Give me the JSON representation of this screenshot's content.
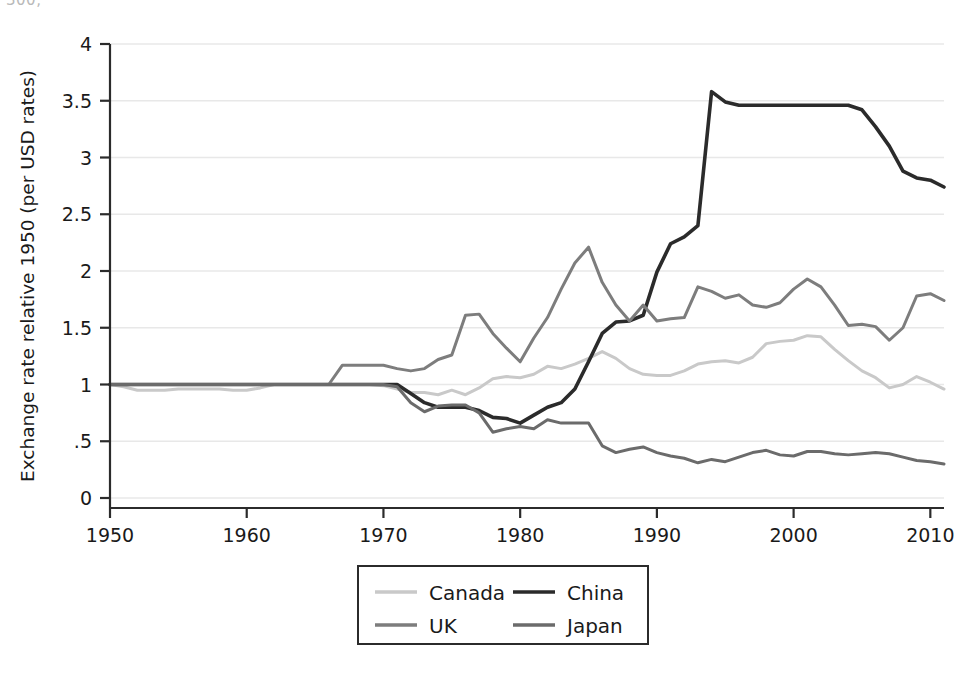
{
  "figure": {
    "clipped_top_text": "300,",
    "background_color": "#ffffff"
  },
  "chart_data": {
    "type": "line",
    "title": "",
    "xlabel": "",
    "ylabel": "Exchange rate relative 1950 (per USD rates)",
    "xlim": [
      1950,
      2011
    ],
    "ylim": [
      0,
      4
    ],
    "grid": true,
    "grid_axis": "y",
    "legend_position": "bottom-center",
    "xticks": [
      1950,
      1960,
      1970,
      1980,
      1990,
      2000,
      2010
    ],
    "xtick_labels": [
      "1950",
      "1960",
      "1970",
      "1980",
      "1990",
      "2000",
      "2010"
    ],
    "yticks": [
      0,
      0.5,
      1,
      1.5,
      2,
      2.5,
      3,
      3.5,
      4
    ],
    "ytick_labels": [
      "0",
      ".5",
      "1",
      "1.5",
      "2",
      "2.5",
      "3",
      "3.5",
      "4"
    ],
    "x": [
      1950,
      1951,
      1952,
      1953,
      1954,
      1955,
      1956,
      1957,
      1958,
      1959,
      1960,
      1961,
      1962,
      1963,
      1964,
      1965,
      1966,
      1967,
      1968,
      1969,
      1970,
      1971,
      1972,
      1973,
      1974,
      1975,
      1976,
      1977,
      1978,
      1979,
      1980,
      1981,
      1982,
      1983,
      1984,
      1985,
      1986,
      1987,
      1988,
      1989,
      1990,
      1991,
      1992,
      1993,
      1994,
      1995,
      1996,
      1997,
      1998,
      1999,
      2000,
      2001,
      2002,
      2003,
      2004,
      2005,
      2006,
      2007,
      2008,
      2009,
      2010,
      2011
    ],
    "series": [
      {
        "name": "Canada",
        "color": "#c9c9c9",
        "width": 3.0,
        "values": [
          1.0,
          0.98,
          0.95,
          0.95,
          0.95,
          0.96,
          0.96,
          0.96,
          0.96,
          0.95,
          0.95,
          0.97,
          1.0,
          1.0,
          1.0,
          1.0,
          1.0,
          1.0,
          1.0,
          1.0,
          0.99,
          0.96,
          0.93,
          0.93,
          0.91,
          0.95,
          0.91,
          0.97,
          1.05,
          1.07,
          1.06,
          1.09,
          1.16,
          1.14,
          1.18,
          1.23,
          1.29,
          1.23,
          1.14,
          1.09,
          1.08,
          1.08,
          1.12,
          1.18,
          1.2,
          1.21,
          1.19,
          1.24,
          1.36,
          1.38,
          1.39,
          1.43,
          1.42,
          1.31,
          1.21,
          1.12,
          1.06,
          0.97,
          1.0,
          1.07,
          1.02,
          0.96
        ]
      },
      {
        "name": "China",
        "color": "#2b2b2b",
        "width": 3.6,
        "values": [
          1.0,
          1.0,
          1.0,
          1.0,
          1.0,
          1.0,
          1.0,
          1.0,
          1.0,
          1.0,
          1.0,
          1.0,
          1.0,
          1.0,
          1.0,
          1.0,
          1.0,
          1.0,
          1.0,
          1.0,
          1.0,
          1.0,
          0.92,
          0.84,
          0.8,
          0.8,
          0.8,
          0.77,
          0.71,
          0.7,
          0.66,
          0.73,
          0.8,
          0.84,
          0.96,
          1.2,
          1.45,
          1.55,
          1.56,
          1.61,
          1.99,
          2.24,
          2.3,
          2.4,
          3.58,
          3.49,
          3.46,
          3.46,
          3.46,
          3.46,
          3.46,
          3.46,
          3.46,
          3.46,
          3.46,
          3.42,
          3.27,
          3.1,
          2.88,
          2.82,
          2.8,
          2.74
        ]
      },
      {
        "name": "UK",
        "color": "#7d7d7d",
        "width": 3.0,
        "values": [
          1.0,
          1.0,
          1.0,
          1.0,
          1.0,
          1.0,
          1.0,
          1.0,
          1.0,
          1.0,
          1.0,
          1.0,
          1.0,
          1.0,
          1.0,
          1.0,
          1.0,
          1.17,
          1.17,
          1.17,
          1.17,
          1.14,
          1.12,
          1.14,
          1.22,
          1.26,
          1.61,
          1.62,
          1.45,
          1.32,
          1.2,
          1.41,
          1.59,
          1.84,
          2.07,
          2.21,
          1.9,
          1.7,
          1.56,
          1.7,
          1.56,
          1.58,
          1.59,
          1.86,
          1.82,
          1.76,
          1.79,
          1.7,
          1.68,
          1.72,
          1.84,
          1.93,
          1.86,
          1.7,
          1.52,
          1.53,
          1.51,
          1.39,
          1.5,
          1.78,
          1.8,
          1.74
        ]
      },
      {
        "name": "Japan",
        "color": "#6b6b6b",
        "width": 3.0,
        "values": [
          1.0,
          1.0,
          1.0,
          1.0,
          1.0,
          1.0,
          1.0,
          1.0,
          1.0,
          1.0,
          1.0,
          1.0,
          1.0,
          1.0,
          1.0,
          1.0,
          1.0,
          1.0,
          1.0,
          1.0,
          1.0,
          0.98,
          0.84,
          0.76,
          0.81,
          0.82,
          0.82,
          0.75,
          0.58,
          0.61,
          0.63,
          0.61,
          0.69,
          0.66,
          0.66,
          0.66,
          0.46,
          0.4,
          0.43,
          0.45,
          0.4,
          0.37,
          0.35,
          0.31,
          0.34,
          0.32,
          0.36,
          0.4,
          0.42,
          0.38,
          0.37,
          0.41,
          0.41,
          0.39,
          0.38,
          0.39,
          0.4,
          0.39,
          0.36,
          0.33,
          0.32,
          0.3
        ]
      }
    ]
  },
  "legend": {
    "entries": [
      {
        "label": "Canada",
        "color": "#c9c9c9"
      },
      {
        "label": "China",
        "color": "#2b2b2b"
      },
      {
        "label": "UK",
        "color": "#7d7d7d"
      },
      {
        "label": "Japan",
        "color": "#6b6b6b"
      }
    ]
  }
}
